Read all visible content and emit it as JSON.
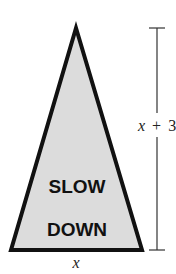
{
  "figure": {
    "sign": {
      "shape": "triangle",
      "fill_color": "#dcdcdc",
      "stroke_color": "#111111",
      "line1": "SLOW",
      "line2": "DOWN"
    },
    "base_label": {
      "variable": "x"
    },
    "height_label": {
      "variable": "x",
      "operator": "+",
      "constant": "3"
    }
  }
}
